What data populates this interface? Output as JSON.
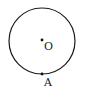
{
  "diagram": {
    "type": "geometry-circle",
    "circle": {
      "cx": 42,
      "cy": 41,
      "r": 33,
      "stroke": "#1a1a1a"
    },
    "points": [
      {
        "id": "center",
        "label": "O",
        "x": 42,
        "y": 40,
        "label_x": 44,
        "label_y": 50
      },
      {
        "id": "A",
        "label": "A",
        "x": 42,
        "y": 74,
        "label_x": 44,
        "label_y": 86
      }
    ]
  }
}
